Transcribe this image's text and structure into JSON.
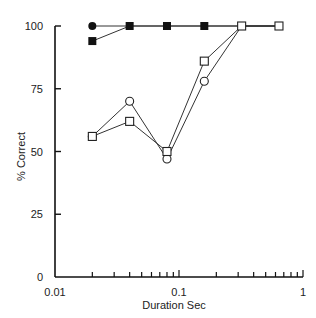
{
  "chart_data": {
    "type": "line",
    "title": "",
    "xlabel": "Duration Sec",
    "ylabel": "% Correct",
    "xscale": "log",
    "xlim": [
      0.01,
      1
    ],
    "ylim": [
      0,
      100
    ],
    "x_tick_labels": [
      "0.01",
      "0.1",
      "1"
    ],
    "y_tick_labels": [
      "0",
      "25",
      "50",
      "75",
      "100"
    ],
    "grid": false,
    "legend": null,
    "series": [
      {
        "name": "filled-circle",
        "marker": "filled-circle",
        "x": [
          0.02,
          0.04,
          0.08,
          0.16,
          0.32,
          0.64
        ],
        "values": [
          100,
          100,
          100,
          100,
          100,
          100
        ]
      },
      {
        "name": "filled-square",
        "marker": "filled-square",
        "x": [
          0.02,
          0.04,
          0.08,
          0.16,
          0.32,
          0.64
        ],
        "values": [
          94,
          100,
          100,
          100,
          100,
          100
        ]
      },
      {
        "name": "open-circle",
        "marker": "open-circle",
        "x": [
          0.02,
          0.04,
          0.08,
          0.16,
          0.32,
          0.64
        ],
        "values": [
          56,
          70,
          47,
          78,
          100,
          100
        ]
      },
      {
        "name": "open-square",
        "marker": "open-square",
        "x": [
          0.02,
          0.04,
          0.08,
          0.16,
          0.32,
          0.64
        ],
        "values": [
          56,
          62,
          50,
          86,
          100,
          100
        ]
      }
    ]
  }
}
